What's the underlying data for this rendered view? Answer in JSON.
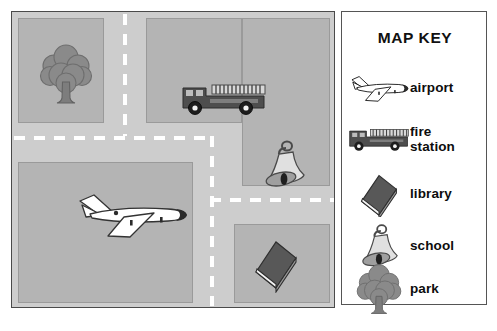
{
  "map": {
    "title": "city street map",
    "roads": {
      "surface_color": "#cdcdcd",
      "lane_marking_color": "#ffffff",
      "style": "dashed-center-line"
    },
    "blocks": [
      {
        "name": "park-block",
        "fill": "#b4b4b4"
      },
      {
        "name": "fire-station-block",
        "fill": "#b4b4b4"
      },
      {
        "name": "airport-block",
        "fill": "#b4b4b4"
      },
      {
        "name": "school-block",
        "fill": "#b4b4b4"
      },
      {
        "name": "library-block",
        "fill": "#b4b4b4"
      }
    ],
    "placed_icons": [
      {
        "name": "tree-icon",
        "meaning": "park"
      },
      {
        "name": "fire-truck-icon",
        "meaning": "fire station"
      },
      {
        "name": "airplane-icon",
        "meaning": "airport"
      },
      {
        "name": "bell-icon",
        "meaning": "school"
      },
      {
        "name": "book-icon",
        "meaning": "library"
      }
    ]
  },
  "key": {
    "title": "MAP KEY",
    "entries": [
      {
        "icon": "airplane-icon",
        "label": "airport"
      },
      {
        "icon": "fire-truck-icon",
        "label": "fire\nstation",
        "line1": "fire",
        "line2": "station"
      },
      {
        "icon": "book-icon",
        "label": "library"
      },
      {
        "icon": "bell-icon",
        "label": "school"
      },
      {
        "icon": "tree-icon",
        "label": "park"
      }
    ]
  },
  "colors": {
    "page_background": "#ffffff",
    "road": "#cdcdcd",
    "block": "#b4b4b4",
    "block_outline": "#9a9a9a",
    "border": "#4a4a4a",
    "text": "#111111",
    "icon_dark": "#4f4f4f",
    "icon_mid": "#8d8d8d",
    "icon_light": "#e8e8e8"
  }
}
